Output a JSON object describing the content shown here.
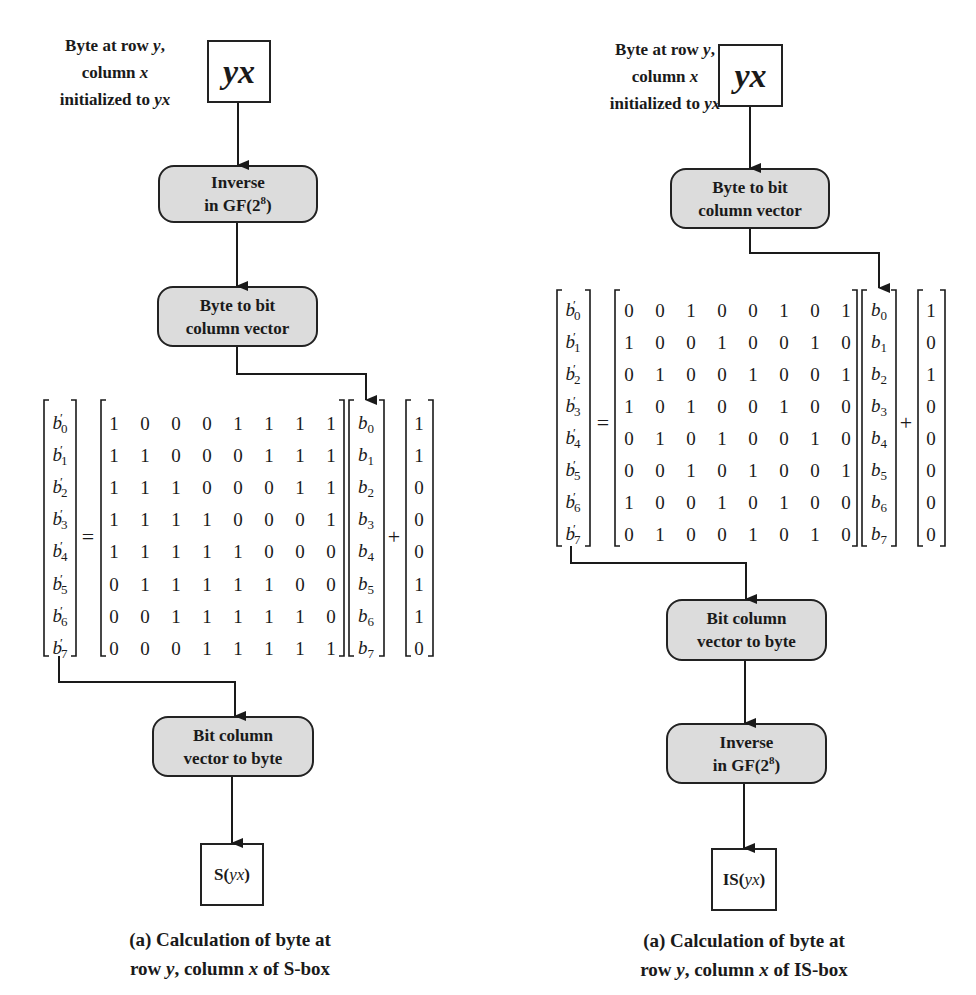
{
  "left": {
    "input_label": {
      "line1_pre": "Byte at row ",
      "line1_var": "y",
      "line1_post": ",",
      "line2_pre": "column ",
      "line2_var": "x",
      "line3_pre": "initialized to ",
      "line3_var": "yx"
    },
    "input_box": "yx",
    "steps": [
      {
        "line1": "Inverse",
        "line2_pre": "in GF(2",
        "line2_sup": "8",
        "line2_post": ")"
      },
      {
        "line1": "Byte to bit",
        "line2": "column vector"
      },
      {
        "line1": "Bit column",
        "line2": "vector to byte"
      }
    ],
    "output_box": {
      "pre": "S(",
      "var": "yx",
      "post": ")"
    },
    "caption": {
      "line1": "(a) Calculation of byte at",
      "line2_a": "row ",
      "line2_y": "y",
      "line2_b": ", column ",
      "line2_x": "x",
      "line2_c": " of S-box"
    },
    "matrix": [
      [
        1,
        0,
        0,
        0,
        1,
        1,
        1,
        1
      ],
      [
        1,
        1,
        0,
        0,
        0,
        1,
        1,
        1
      ],
      [
        1,
        1,
        1,
        0,
        0,
        0,
        1,
        1
      ],
      [
        1,
        1,
        1,
        1,
        0,
        0,
        0,
        1
      ],
      [
        1,
        1,
        1,
        1,
        1,
        0,
        0,
        0
      ],
      [
        0,
        1,
        1,
        1,
        1,
        1,
        0,
        0
      ],
      [
        0,
        0,
        1,
        1,
        1,
        1,
        1,
        0
      ],
      [
        0,
        0,
        0,
        1,
        1,
        1,
        1,
        1
      ]
    ],
    "constant": [
      1,
      1,
      0,
      0,
      0,
      1,
      1,
      0
    ]
  },
  "right": {
    "input_label": {
      "line1_pre": "Byte at row ",
      "line1_var": "y",
      "line1_post": ",",
      "line2_pre": "column ",
      "line2_var": "x",
      "line3_pre": "initialized to ",
      "line3_var": "yx"
    },
    "input_box": "yx",
    "steps": [
      {
        "line1": "Byte to bit",
        "line2": "column vector"
      },
      {
        "line1": "Bit column",
        "line2": "vector to byte"
      },
      {
        "line1": "Inverse",
        "line2_pre": "in GF(2",
        "line2_sup": "8",
        "line2_post": ")"
      }
    ],
    "output_box": {
      "pre": "IS(",
      "var": "yx",
      "post": ")"
    },
    "caption": {
      "line1": "(a) Calculation of byte at",
      "line2_a": "row ",
      "line2_y": "y",
      "line2_b": ", column ",
      "line2_x": "x",
      "line2_c": " of IS-box"
    },
    "matrix": [
      [
        0,
        0,
        1,
        0,
        0,
        1,
        0,
        1
      ],
      [
        1,
        0,
        0,
        1,
        0,
        0,
        1,
        0
      ],
      [
        0,
        1,
        0,
        0,
        1,
        0,
        0,
        1
      ],
      [
        1,
        0,
        1,
        0,
        0,
        1,
        0,
        0
      ],
      [
        0,
        1,
        0,
        1,
        0,
        0,
        1,
        0
      ],
      [
        0,
        0,
        1,
        0,
        1,
        0,
        0,
        1
      ],
      [
        1,
        0,
        0,
        1,
        0,
        1,
        0,
        0
      ],
      [
        0,
        1,
        0,
        0,
        1,
        0,
        1,
        0
      ]
    ],
    "constant": [
      1,
      0,
      1,
      0,
      0,
      0,
      0,
      0
    ]
  },
  "symbols": {
    "equals": "=",
    "plus": "+",
    "prime": "′",
    "output_var": "b′",
    "input_var": "b"
  },
  "colors": {
    "process_fill": "#dcdcdc",
    "stroke": "#222222"
  }
}
